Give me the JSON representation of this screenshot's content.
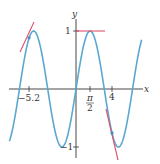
{
  "chart_data": {
    "type": "line",
    "title": "",
    "function": "y = sin(x)",
    "xlabel": "x",
    "ylabel": "y",
    "xlim": [
      -7.4,
      7.3
    ],
    "ylim": [
      -1.1,
      1.1
    ],
    "grid": false,
    "x_ticks": [
      {
        "value": -5.2,
        "label": "−5.2"
      },
      {
        "value": 1.5708,
        "label_num": "π",
        "label_den": "2"
      },
      {
        "value": 4,
        "label": "4"
      }
    ],
    "y_ticks": [
      {
        "value": 1,
        "label": "1"
      },
      {
        "value": -1,
        "label": "−1"
      }
    ],
    "series": [
      {
        "name": "sin(x)",
        "color": "#5aa8d2"
      }
    ],
    "tangent_lines": [
      {
        "at_x": -5.2,
        "point_y": 0.883,
        "slope": 0.468,
        "color": "#e0506a"
      },
      {
        "at_x": 1.5708,
        "point_y": 1.0,
        "slope": 0.0,
        "color": "#e0506a"
      },
      {
        "at_x": 4,
        "point_y": -0.757,
        "slope": -0.654,
        "color": "#e0506a"
      }
    ]
  },
  "labels": {
    "x_axis": "x",
    "y_axis": "y",
    "tick_neg52": "−5.2",
    "tick_pi": "π",
    "tick_two": "2",
    "tick_four": "4",
    "tick_one": "1",
    "tick_neg_one": "−1"
  }
}
